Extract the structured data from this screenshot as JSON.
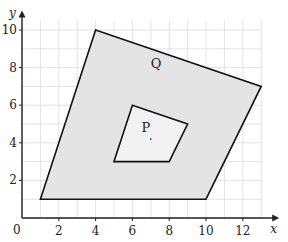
{
  "diagram": {
    "type": "coordinate-grid-polygons",
    "axes": {
      "x_label": "x",
      "y_label": "y",
      "origin_label": "0",
      "x_ticks": [
        "2",
        "4",
        "6",
        "8",
        "10",
        "12"
      ],
      "y_ticks": [
        "2",
        "4",
        "6",
        "8",
        "10"
      ],
      "x_range": [
        0,
        13
      ],
      "y_range": [
        0,
        10.5
      ]
    },
    "shapes": {
      "Q": {
        "label": "Q",
        "vertices": [
          [
            1,
            1
          ],
          [
            4,
            10
          ],
          [
            13,
            7
          ],
          [
            10,
            1
          ]
        ],
        "fill": "#e4e4e4",
        "label_pos": [
          7,
          8
        ]
      },
      "P": {
        "label": "P",
        "vertices": [
          [
            5,
            3
          ],
          [
            6,
            6
          ],
          [
            9,
            5
          ],
          [
            8,
            3
          ]
        ],
        "fill": "#f2f2f2",
        "label_pos": [
          6.5,
          4.6
        ]
      }
    },
    "marked_point": [
      7,
      4.2
    ],
    "colors": {
      "grid": "#dcdcdc",
      "outline": "#111111",
      "axis": "#222222"
    }
  }
}
